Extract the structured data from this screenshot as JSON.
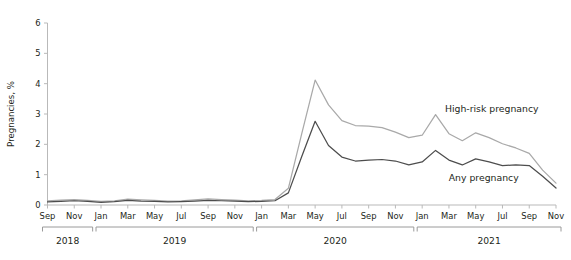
{
  "chart_data": {
    "type": "line",
    "title": "",
    "xlabel": "",
    "ylabel": "Pregnancies, %",
    "ylim": [
      0,
      6
    ],
    "yticks": [
      0,
      1,
      2,
      3,
      4,
      5,
      6
    ],
    "grid": false,
    "legend_position": "inline-annotation",
    "x": [
      "Sep 2018",
      "Oct 2018",
      "Nov 2018",
      "Dec 2018",
      "Jan 2019",
      "Feb 2019",
      "Mar 2019",
      "Apr 2019",
      "May 2019",
      "Jun 2019",
      "Jul 2019",
      "Aug 2019",
      "Sep 2019",
      "Oct 2019",
      "Nov 2019",
      "Dec 2019",
      "Jan 2020",
      "Feb 2020",
      "Mar 2020",
      "Apr 2020",
      "May 2020",
      "Jun 2020",
      "Jul 2020",
      "Aug 2020",
      "Sep 2020",
      "Oct 2020",
      "Nov 2020",
      "Dec 2020",
      "Jan 2021",
      "Feb 2021",
      "Mar 2021",
      "Apr 2021",
      "May 2021",
      "Jun 2021",
      "Jul 2021",
      "Aug 2021",
      "Sep 2021",
      "Oct 2021",
      "Nov 2021"
    ],
    "xtick_labels": [
      "Sep",
      "Nov",
      "Jan",
      "Mar",
      "May",
      "Jul",
      "Sep",
      "Nov",
      "Jan",
      "Mar",
      "May",
      "Jul",
      "Sep",
      "Nov",
      "Jan",
      "Mar",
      "May",
      "Jul",
      "Sep",
      "Nov"
    ],
    "xtick_indices": [
      0,
      2,
      4,
      6,
      8,
      10,
      12,
      14,
      16,
      18,
      20,
      22,
      24,
      26,
      28,
      30,
      32,
      34,
      36,
      38
    ],
    "year_groups": [
      {
        "label": "2018",
        "start_index": 0,
        "end_index": 3
      },
      {
        "label": "2019",
        "start_index": 4,
        "end_index": 15
      },
      {
        "label": "2020",
        "start_index": 16,
        "end_index": 27
      },
      {
        "label": "2021",
        "start_index": 28,
        "end_index": 38
      }
    ],
    "series": [
      {
        "name": "High-risk pregnancy",
        "color": "#a9a9a9",
        "label_x_index": 33.2,
        "label_y_value": 3.05,
        "values": [
          0.14,
          0.16,
          0.18,
          0.15,
          0.12,
          0.14,
          0.19,
          0.17,
          0.15,
          0.13,
          0.14,
          0.17,
          0.2,
          0.18,
          0.16,
          0.14,
          0.15,
          0.18,
          0.55,
          2.35,
          4.12,
          3.3,
          2.78,
          2.62,
          2.6,
          2.55,
          2.4,
          2.22,
          2.3,
          2.98,
          2.35,
          2.12,
          2.38,
          2.22,
          2.02,
          1.88,
          1.7,
          1.15,
          0.72
        ]
      },
      {
        "name": "Any pregnancy",
        "color": "#4d4d4d",
        "label_x_index": 32.6,
        "label_y_value": 0.78,
        "values": [
          0.1,
          0.12,
          0.14,
          0.12,
          0.09,
          0.11,
          0.15,
          0.13,
          0.12,
          0.1,
          0.11,
          0.13,
          0.15,
          0.14,
          0.13,
          0.11,
          0.12,
          0.14,
          0.4,
          1.6,
          2.76,
          1.96,
          1.58,
          1.45,
          1.48,
          1.5,
          1.45,
          1.32,
          1.42,
          1.8,
          1.48,
          1.32,
          1.52,
          1.42,
          1.3,
          1.32,
          1.3,
          0.95,
          0.56
        ]
      }
    ]
  }
}
